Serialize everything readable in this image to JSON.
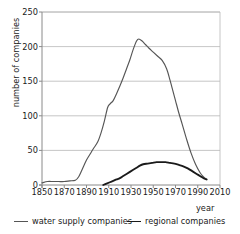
{
  "chart_data": {
    "type": "line",
    "title": "",
    "xlabel": "year",
    "ylabel": "number of companies",
    "xlim": [
      1850,
      2010
    ],
    "ylim": [
      0,
      250
    ],
    "xticks": [
      1850,
      1870,
      1890,
      1910,
      1930,
      1950,
      1970,
      1990,
      2010
    ],
    "yticks": [
      0,
      50,
      100,
      150,
      200,
      250
    ],
    "grid": "horizontal",
    "legend_position": "below",
    "series": [
      {
        "name": "water supply companies",
        "color": "#555555",
        "x": [
          1850,
          1855,
          1860,
          1865,
          1870,
          1875,
          1880,
          1883,
          1886,
          1890,
          1893,
          1896,
          1900,
          1903,
          1906,
          1909,
          1911,
          1914,
          1917,
          1920,
          1923,
          1926,
          1929,
          1932,
          1935,
          1937,
          1940,
          1943,
          1946,
          1950,
          1954,
          1958,
          1962,
          1965,
          1967,
          1970,
          1973,
          1976,
          1980,
          1984,
          1988,
          1992,
          1995,
          1998
        ],
        "y": [
          3,
          5,
          5,
          5,
          5,
          6,
          7,
          12,
          22,
          36,
          44,
          52,
          62,
          75,
          92,
          112,
          117,
          122,
          132,
          143,
          155,
          168,
          181,
          196,
          208,
          211,
          208,
          203,
          198,
          192,
          186,
          180,
          168,
          152,
          140,
          122,
          104,
          88,
          66,
          46,
          30,
          18,
          12,
          8
        ]
      },
      {
        "name": "regional companies",
        "color": "#1a1a1a",
        "x": [
          1905,
          1908,
          1911,
          1914,
          1917,
          1920,
          1923,
          1926,
          1929,
          1932,
          1935,
          1938,
          1941,
          1945,
          1949,
          1953,
          1957,
          1961,
          1965,
          1969,
          1973,
          1977,
          1981,
          1985,
          1989,
          1993,
          1996,
          1998
        ],
        "y": [
          0,
          2,
          4,
          6,
          8,
          10,
          13,
          16,
          19,
          22,
          25,
          28,
          30,
          31,
          32,
          33,
          33,
          33,
          32,
          31,
          29,
          27,
          24,
          20,
          16,
          12,
          9,
          8
        ]
      }
    ]
  },
  "axes": {
    "ylabel": "number of companies",
    "xlabel": "year"
  },
  "legend": {
    "items": [
      {
        "label": "water supply companies"
      },
      {
        "label": "regional companies"
      }
    ]
  },
  "colors": {
    "water_supply": "#555555",
    "regional": "#1a1a1a",
    "grid": "#b8b8b8",
    "axis": "#8a8a8a",
    "background": "#ffffff"
  },
  "plot_geometry": {
    "left": 42,
    "right": 220,
    "top": 12,
    "bottom": 185
  }
}
